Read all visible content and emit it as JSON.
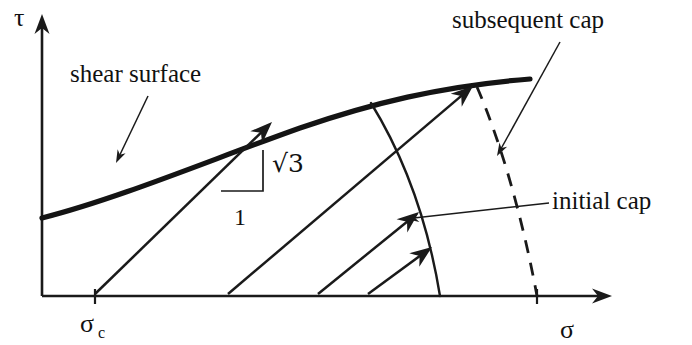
{
  "figure": {
    "background_color": "#ffffff",
    "ink_color": "#1a1a1a"
  },
  "axes": {
    "y_axis": {
      "label": "τ",
      "name": "shear-stress-axis",
      "label_x": 14,
      "label_y": 26
    },
    "x_axis": {
      "label": "σ",
      "name": "mean-stress-axis",
      "label_x": 560,
      "label_y": 338
    },
    "origin": {
      "x": 42,
      "y": 296
    },
    "x_end": {
      "x": 612,
      "y": 296
    },
    "y_end": {
      "x": 42,
      "y": 14
    }
  },
  "ticks": [
    {
      "name": "sigma-c-tick",
      "label": "σ",
      "subscript": "c",
      "x": 95,
      "label_x": 80,
      "label_y": 332,
      "subscript_x": 98,
      "subscript_y": 338
    },
    {
      "name": "subsequent-cap-axis-tick",
      "label": "",
      "subscript": "",
      "x": 537,
      "label_x": 0,
      "label_y": 0,
      "subscript_x": 0,
      "subscript_y": 0
    }
  ],
  "annotations": [
    {
      "name": "shear-surface-label",
      "text": "shear surface",
      "x": 70,
      "y": 82,
      "leader_from": {
        "x": 148,
        "y": 96
      },
      "leader_to": {
        "x": 116,
        "y": 163
      }
    },
    {
      "name": "subsequent-cap-label",
      "text": "subsequent cap",
      "x": 452,
      "y": 28,
      "leader_from": {
        "x": 560,
        "y": 42
      },
      "leader_to": {
        "x": 497,
        "y": 156
      }
    },
    {
      "name": "initial-cap-label",
      "text": "initial cap",
      "x": 552,
      "y": 209,
      "leader_from": {
        "x": 549,
        "y": 203
      },
      "leader_to": {
        "x": 406,
        "y": 219
      }
    }
  ],
  "slope_triangle": {
    "name": "slope-triangle",
    "vertical_label": "√3",
    "horizontal_label": "1",
    "corner": {
      "x": 263,
      "y": 191
    },
    "top": {
      "x": 263,
      "y": 150
    },
    "left": {
      "x": 221,
      "y": 191
    },
    "vertical_label_x": 272,
    "vertical_label_y": 172,
    "horizontal_label_x": 234,
    "horizontal_label_y": 225
  },
  "curves": {
    "shear_surface": {
      "name": "shear-surface-curve",
      "style": "solid-thick",
      "path": "M 42 218 C 120 198 210 160 300 128 C 370 104 440 86 530 79"
    },
    "initial_cap": {
      "name": "initial-cap-curve",
      "style": "solid-thin",
      "path": "M 371 103 C 400 150 426 210 440 296"
    },
    "subsequent_cap": {
      "name": "subsequent-cap-curve",
      "style": "dashed",
      "path": "M 477 87 C 500 140 522 215 537 296"
    }
  },
  "vectors": [
    {
      "name": "plastic-strain-vector-1",
      "from": {
        "x": 95,
        "y": 294
      },
      "to": {
        "x": 272,
        "y": 122
      }
    },
    {
      "name": "plastic-strain-vector-2",
      "from": {
        "x": 228,
        "y": 294
      },
      "to": {
        "x": 473,
        "y": 86
      }
    },
    {
      "name": "plastic-strain-vector-3",
      "from": {
        "x": 318,
        "y": 294
      },
      "to": {
        "x": 419,
        "y": 212
      }
    },
    {
      "name": "plastic-strain-vector-4",
      "from": {
        "x": 368,
        "y": 294
      },
      "to": {
        "x": 432,
        "y": 247
      }
    }
  ]
}
